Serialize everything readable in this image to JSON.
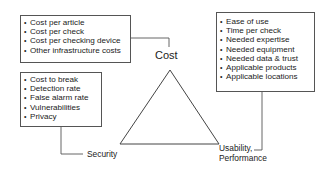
{
  "diagram": {
    "type": "triangle-tradeoff",
    "vertices": {
      "top": "Cost",
      "bottom_left": "Security",
      "bottom_right_line1": "Usability,",
      "bottom_right_line2": "Performance"
    },
    "boxes": {
      "cost": {
        "items": [
          "Cost per article",
          "Cost per check",
          "Cost per checking device",
          "Other infrastructure costs"
        ]
      },
      "security": {
        "items": [
          "Cost to break",
          "Detection rate",
          "False alarm rate",
          "Vulnerabilities",
          "Privacy"
        ]
      },
      "usability": {
        "items": [
          "Ease of use",
          "Time per check",
          "Needed expertise",
          "Needed equipment",
          "Needed data & trust",
          "Applicable products",
          "Applicable locations"
        ]
      }
    },
    "colors": {
      "line": "#444444",
      "box_border": "#555555",
      "text": "#222222",
      "background": "#ffffff"
    }
  }
}
